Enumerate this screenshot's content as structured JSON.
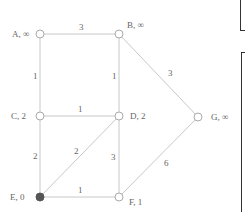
{
  "graph": {
    "nodes": [
      {
        "id": "A",
        "label": "A, ∞",
        "x": 40,
        "y": 34,
        "filled": false,
        "lx": 12,
        "ly": 37
      },
      {
        "id": "B",
        "label": "B, ∞",
        "x": 119,
        "y": 34,
        "filled": false,
        "lx": 127,
        "ly": 28
      },
      {
        "id": "C",
        "label": "C, 2",
        "x": 40,
        "y": 116,
        "filled": false,
        "lx": 11,
        "ly": 119
      },
      {
        "id": "D",
        "label": "D, 2",
        "x": 119,
        "y": 116,
        "filled": false,
        "lx": 130,
        "ly": 119
      },
      {
        "id": "G",
        "label": "G, ∞",
        "x": 198,
        "y": 117,
        "filled": false,
        "lx": 211,
        "ly": 120
      },
      {
        "id": "E",
        "label": "E, 0",
        "x": 40,
        "y": 197,
        "filled": true,
        "lx": 10,
        "ly": 200
      },
      {
        "id": "F",
        "label": "F, 1",
        "x": 119,
        "y": 197,
        "filled": false,
        "lx": 129,
        "ly": 205
      }
    ],
    "edges": [
      {
        "from": "A",
        "to": "B",
        "weight": "3",
        "wx": 79,
        "wy": 30
      },
      {
        "from": "A",
        "to": "C",
        "weight": "1",
        "wx": 33,
        "wy": 79
      },
      {
        "from": "B",
        "to": "D",
        "weight": "1",
        "wx": 112,
        "wy": 79
      },
      {
        "from": "B",
        "to": "G",
        "weight": "3",
        "wx": 168,
        "wy": 76
      },
      {
        "from": "C",
        "to": "D",
        "weight": "1",
        "wx": 78,
        "wy": 112
      },
      {
        "from": "C",
        "to": "E",
        "weight": "2",
        "wx": 33,
        "wy": 159
      },
      {
        "from": "E",
        "to": "D",
        "weight": "2",
        "wx": 74,
        "wy": 154
      },
      {
        "from": "D",
        "to": "F",
        "weight": "3",
        "wx": 111,
        "wy": 160
      },
      {
        "from": "G",
        "to": "F",
        "weight": "6",
        "wx": 164,
        "wy": 166
      },
      {
        "from": "E",
        "to": "F",
        "weight": "1",
        "wx": 78,
        "wy": 193
      }
    ]
  },
  "colors": {
    "edge": "#c8c8c8",
    "node_stroke": "#aaaaaa",
    "node_fill": "#ffffff",
    "source_fill": "#555555",
    "box_border": "#333333"
  }
}
